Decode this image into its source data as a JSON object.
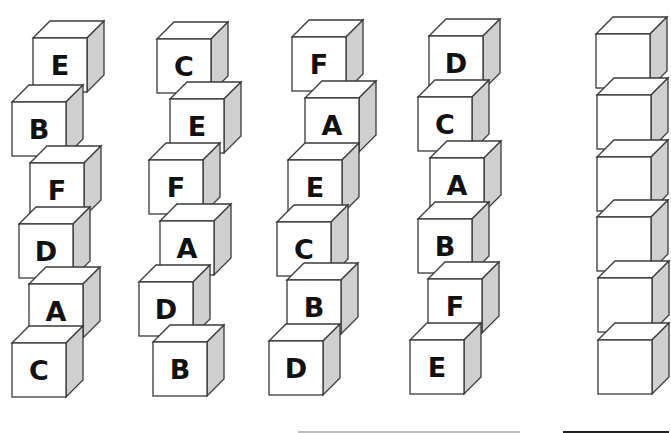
{
  "puzzle": {
    "stacks": [
      {
        "label": "stack-1",
        "blocks": [
          {
            "letter": "E",
            "x": 33,
            "y": 21
          },
          {
            "letter": "B",
            "x": 12,
            "y": 85
          },
          {
            "letter": "F",
            "x": 30,
            "y": 146
          },
          {
            "letter": "D",
            "x": 19,
            "y": 207
          },
          {
            "letter": "A",
            "x": 29,
            "y": 267
          },
          {
            "letter": "C",
            "x": 12,
            "y": 326
          }
        ]
      },
      {
        "label": "stack-2",
        "blocks": [
          {
            "letter": "C",
            "x": 157,
            "y": 22
          },
          {
            "letter": "E",
            "x": 170,
            "y": 82
          },
          {
            "letter": "F",
            "x": 149,
            "y": 143
          },
          {
            "letter": "A",
            "x": 160,
            "y": 204
          },
          {
            "letter": "D",
            "x": 139,
            "y": 265
          },
          {
            "letter": "B",
            "x": 153,
            "y": 325
          }
        ]
      },
      {
        "label": "stack-3",
        "blocks": [
          {
            "letter": "F",
            "x": 292,
            "y": 20
          },
          {
            "letter": "A",
            "x": 305,
            "y": 81
          },
          {
            "letter": "E",
            "x": 288,
            "y": 143
          },
          {
            "letter": "C",
            "x": 277,
            "y": 205
          },
          {
            "letter": "B",
            "x": 287,
            "y": 263
          },
          {
            "letter": "D",
            "x": 269,
            "y": 324
          }
        ]
      },
      {
        "label": "stack-4",
        "blocks": [
          {
            "letter": "D",
            "x": 429,
            "y": 19
          },
          {
            "letter": "C",
            "x": 418,
            "y": 80
          },
          {
            "letter": "A",
            "x": 430,
            "y": 141
          },
          {
            "letter": "B",
            "x": 418,
            "y": 202
          },
          {
            "letter": "F",
            "x": 428,
            "y": 262
          },
          {
            "letter": "E",
            "x": 410,
            "y": 323
          }
        ]
      },
      {
        "label": "stack-5-answer",
        "blocks": [
          {
            "letter": "",
            "x": 596,
            "y": 17
          },
          {
            "letter": "",
            "x": 597,
            "y": 78
          },
          {
            "letter": "",
            "x": 597,
            "y": 140
          },
          {
            "letter": "",
            "x": 597,
            "y": 200
          },
          {
            "letter": "",
            "x": 598,
            "y": 261
          },
          {
            "letter": "",
            "x": 598,
            "y": 323
          }
        ]
      }
    ],
    "colors": {
      "face": "#ffffff",
      "top": "#ffffff",
      "side": "#cfcfcf",
      "edge": "#3a3a3a",
      "letter": "#111111"
    },
    "lines": [
      {
        "x": 298,
        "y": 431,
        "width": 222,
        "color": "#bdbdbd"
      },
      {
        "x": 563,
        "y": 431,
        "width": 106,
        "color": "#222222"
      }
    ]
  }
}
